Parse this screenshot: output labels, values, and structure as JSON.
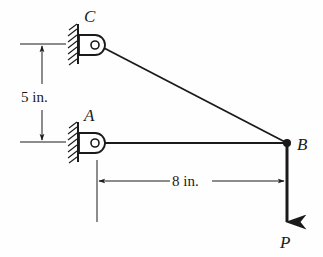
{
  "diagram": {
    "points": {
      "C": {
        "label": "C",
        "x": 95,
        "y": 45
      },
      "A": {
        "label": "A",
        "x": 95,
        "y": 143
      },
      "B": {
        "label": "B",
        "x": 287,
        "y": 143
      }
    },
    "members": [
      {
        "name": "member-CB",
        "from": "C",
        "to": "B"
      },
      {
        "name": "member-AB",
        "from": "A",
        "to": "B"
      }
    ],
    "supports": [
      {
        "name": "pin-support-C",
        "at": "C",
        "type": "wall-pin"
      },
      {
        "name": "pin-support-A",
        "at": "A",
        "type": "wall-pin"
      }
    ],
    "load": {
      "label": "P",
      "at": "B",
      "direction": "down"
    },
    "dimensions": {
      "vertical": {
        "text": "5 in.",
        "between": [
          "C",
          "A"
        ]
      },
      "horizontal": {
        "text": "8 in.",
        "between": [
          "A",
          "B"
        ]
      }
    },
    "colors": {
      "ink": "#1a1a1a",
      "background": "#fefefe"
    }
  }
}
